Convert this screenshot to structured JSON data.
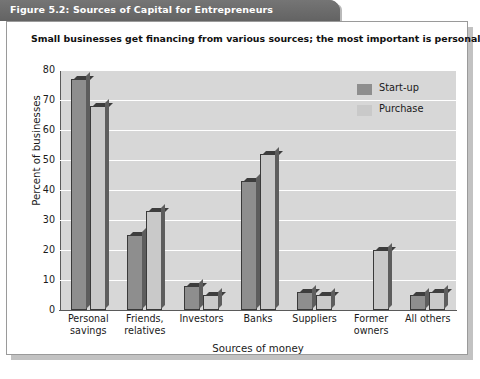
{
  "figure": {
    "title": "Figure 5.2: Sources of Capital for Entrepreneurs",
    "subtitle": "Small businesses get financing from various sources; the most important is personal savings."
  },
  "legend": {
    "items": [
      {
        "label": "Start-up",
        "swatch": "#8e8e8e"
      },
      {
        "label": "Purchase",
        "swatch": "#c9c9c9"
      }
    ]
  },
  "colors": {
    "title_bar": "#6e6e6e",
    "plot_background": "#d7d7d7",
    "gridline": "#ffffff",
    "startup_bar": "#8e8e8e",
    "purchase_bar": "#c9c9c9",
    "bar_outline": "#3a3a3a",
    "panel_border": "#9a9a9a",
    "shadow": "#c2c2c2"
  },
  "chart_data": {
    "type": "bar",
    "title": "Figure 5.2: Sources of Capital for Entrepreneurs",
    "subtitle": "Small businesses get financing from various sources; the most important is personal savings.",
    "xlabel": "Sources of money",
    "ylabel": "Percent of businesses",
    "ylim": [
      0,
      80
    ],
    "yticks": [
      0,
      10,
      20,
      30,
      40,
      50,
      60,
      70,
      80
    ],
    "grid": true,
    "legend_position": "upper right",
    "categories": [
      "Personal savings",
      "Friends, relatives",
      "Investors",
      "Banks",
      "Suppliers",
      "Former owners",
      "All others"
    ],
    "category_lines": [
      [
        "Personal",
        "savings"
      ],
      [
        "Friends,",
        "relatives"
      ],
      [
        "Investors",
        ""
      ],
      [
        "Banks",
        ""
      ],
      [
        "Suppliers",
        ""
      ],
      [
        "Former",
        "owners"
      ],
      [
        "All others",
        ""
      ]
    ],
    "series": [
      {
        "name": "Start-up",
        "values": [
          77,
          25,
          8,
          43,
          6,
          0,
          5
        ]
      },
      {
        "name": "Purchase",
        "values": [
          68,
          33,
          5,
          52,
          5,
          20,
          6
        ]
      }
    ]
  }
}
